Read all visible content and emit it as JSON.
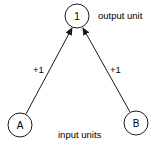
{
  "diagram": {
    "nodes": [
      {
        "id": "output",
        "label": "1",
        "cx": 77,
        "cy": 16,
        "r": 12
      },
      {
        "id": "A",
        "label": "A",
        "cx": 20,
        "cy": 125,
        "r": 12
      },
      {
        "id": "B",
        "label": "B",
        "cx": 136,
        "cy": 123,
        "r": 12
      }
    ],
    "edges": [
      {
        "from": "A",
        "to": "output",
        "weight": "+1"
      },
      {
        "from": "B",
        "to": "output",
        "weight": "+1"
      }
    ],
    "captions": {
      "output": "output unit",
      "input": "input units"
    },
    "colors": {
      "stroke": "#1a1a1a",
      "background": "#ffffff"
    }
  }
}
